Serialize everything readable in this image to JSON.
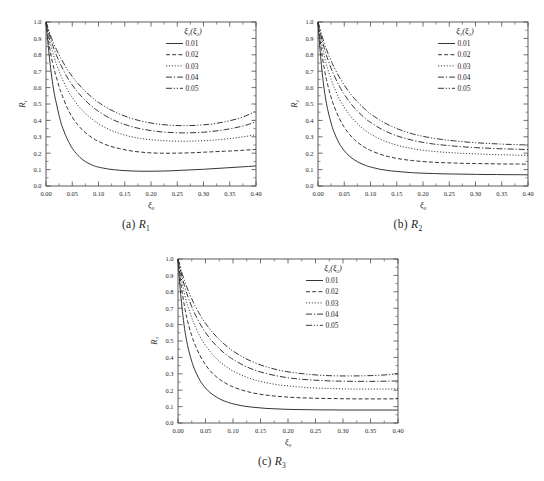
{
  "figure": {
    "background": "#ffffff",
    "line_color": "#2b2b2b",
    "axis_color": "#4a4a4a"
  },
  "panels": [
    {
      "id": "a",
      "caption_prefix": "(a)",
      "caption_symbol": "R",
      "caption_subscript": "1"
    },
    {
      "id": "b",
      "caption_prefix": "(b)",
      "caption_symbol": "R",
      "caption_subscript": "2"
    },
    {
      "id": "c",
      "caption_prefix": "(c)",
      "caption_symbol": "R",
      "caption_subscript": "3"
    }
  ],
  "legend": {
    "header_main": "ξ",
    "header_sub1": "1",
    "header_paren_open": "(",
    "header_main2": "ξ",
    "header_sub2": "2",
    "header_paren_close": ")",
    "entries": [
      {
        "label": "0.01",
        "dash": "none"
      },
      {
        "label": "0.02",
        "dash": "4,2.2"
      },
      {
        "label": "0.03",
        "dash": "1.1,1.8"
      },
      {
        "label": "0.04",
        "dash": "6,2,1.2,2"
      },
      {
        "label": "0.05",
        "dash": "6,1.8,1.2,1.8,1.2,1.8"
      }
    ]
  },
  "chart_data": [
    {
      "type": "line",
      "title": "(a) R1",
      "xlabel": "ξ0",
      "ylabel": "R1",
      "xlim": [
        0.0,
        0.4
      ],
      "ylim": [
        0.0,
        1.0
      ],
      "xticks": [
        "0.00",
        "0.05",
        "0.10",
        "0.15",
        "0.20",
        "0.25",
        "0.30",
        "0.35",
        "0.40"
      ],
      "yticks": [
        "0.0",
        "0.1",
        "0.2",
        "0.3",
        "0.4",
        "0.5",
        "0.6",
        "0.7",
        "0.8",
        "0.9",
        "1.0"
      ],
      "grid": false,
      "legend_position": "top-right",
      "legend_title": "ξ1(ξ2)",
      "x": [
        0.0,
        0.002,
        0.005,
        0.008,
        0.012,
        0.016,
        0.02,
        0.025,
        0.03,
        0.04,
        0.05,
        0.06,
        0.07,
        0.08,
        0.09,
        0.1,
        0.12,
        0.14,
        0.16,
        0.18,
        0.2,
        0.22,
        0.24,
        0.26,
        0.28,
        0.3,
        0.32,
        0.34,
        0.36,
        0.38,
        0.4
      ],
      "series": [
        {
          "name": "0.01",
          "dash": "none",
          "values": [
            1.0,
            0.93,
            0.83,
            0.74,
            0.64,
            0.56,
            0.5,
            0.43,
            0.37,
            0.29,
            0.23,
            0.19,
            0.16,
            0.14,
            0.125,
            0.115,
            0.103,
            0.096,
            0.092,
            0.09,
            0.09,
            0.091,
            0.093,
            0.096,
            0.099,
            0.102,
            0.106,
            0.11,
            0.114,
            0.118,
            0.122
          ]
        },
        {
          "name": "0.02",
          "dash": "4,2.2",
          "values": [
            1.0,
            0.955,
            0.885,
            0.825,
            0.76,
            0.705,
            0.66,
            0.605,
            0.56,
            0.48,
            0.42,
            0.375,
            0.34,
            0.312,
            0.29,
            0.272,
            0.245,
            0.228,
            0.215,
            0.207,
            0.202,
            0.2,
            0.2,
            0.201,
            0.203,
            0.206,
            0.209,
            0.212,
            0.215,
            0.219,
            0.223
          ]
        },
        {
          "name": "0.03",
          "dash": "1.1,1.8",
          "values": [
            1.0,
            0.97,
            0.92,
            0.875,
            0.825,
            0.78,
            0.742,
            0.7,
            0.66,
            0.592,
            0.54,
            0.495,
            0.458,
            0.428,
            0.402,
            0.38,
            0.345,
            0.32,
            0.302,
            0.29,
            0.282,
            0.277,
            0.274,
            0.273,
            0.274,
            0.276,
            0.28,
            0.286,
            0.293,
            0.302,
            0.313
          ]
        },
        {
          "name": "0.04",
          "dash": "6,2,1.2,2",
          "values": [
            1.0,
            0.978,
            0.94,
            0.905,
            0.865,
            0.828,
            0.796,
            0.76,
            0.726,
            0.665,
            0.616,
            0.574,
            0.538,
            0.506,
            0.479,
            0.455,
            0.416,
            0.387,
            0.365,
            0.349,
            0.338,
            0.33,
            0.326,
            0.324,
            0.325,
            0.328,
            0.334,
            0.343,
            0.355,
            0.37,
            0.392
          ]
        },
        {
          "name": "0.05",
          "dash": "6,1.8,1.2,1.8,1.2,1.8",
          "values": [
            1.0,
            0.982,
            0.952,
            0.924,
            0.89,
            0.859,
            0.831,
            0.799,
            0.769,
            0.714,
            0.668,
            0.628,
            0.593,
            0.562,
            0.534,
            0.51,
            0.47,
            0.439,
            0.415,
            0.397,
            0.384,
            0.375,
            0.37,
            0.368,
            0.369,
            0.373,
            0.38,
            0.391,
            0.406,
            0.427,
            0.458
          ]
        }
      ]
    },
    {
      "type": "line",
      "title": "(b) R2",
      "xlabel": "ξ0",
      "ylabel": "R2",
      "xlim": [
        0.0,
        0.4
      ],
      "ylim": [
        0.0,
        1.0
      ],
      "xticks": [
        "0.00",
        "0.05",
        "0.10",
        "0.15",
        "0.20",
        "0.25",
        "0.30",
        "0.35",
        "0.40"
      ],
      "yticks": [
        "0.0",
        "0.1",
        "0.2",
        "0.3",
        "0.4",
        "0.5",
        "0.6",
        "0.7",
        "0.8",
        "0.9",
        "1.0"
      ],
      "grid": false,
      "legend_position": "top-right",
      "legend_title": "ξ1(ξ2)",
      "x": [
        0.0,
        0.002,
        0.005,
        0.008,
        0.012,
        0.016,
        0.02,
        0.025,
        0.03,
        0.04,
        0.05,
        0.06,
        0.07,
        0.08,
        0.09,
        0.1,
        0.12,
        0.14,
        0.16,
        0.18,
        0.2,
        0.22,
        0.24,
        0.26,
        0.28,
        0.3,
        0.32,
        0.34,
        0.36,
        0.38,
        0.4
      ],
      "series": [
        {
          "name": "0.01",
          "dash": "none",
          "values": [
            1.0,
            0.905,
            0.79,
            0.69,
            0.585,
            0.505,
            0.445,
            0.383,
            0.333,
            0.262,
            0.215,
            0.182,
            0.158,
            0.14,
            0.126,
            0.116,
            0.101,
            0.092,
            0.086,
            0.081,
            0.078,
            0.076,
            0.074,
            0.073,
            0.072,
            0.071,
            0.07,
            0.07,
            0.069,
            0.069,
            0.068
          ]
        },
        {
          "name": "0.02",
          "dash": "4,2.2",
          "values": [
            1.0,
            0.945,
            0.865,
            0.795,
            0.715,
            0.65,
            0.598,
            0.54,
            0.492,
            0.416,
            0.358,
            0.315,
            0.281,
            0.255,
            0.234,
            0.217,
            0.192,
            0.175,
            0.163,
            0.155,
            0.149,
            0.145,
            0.142,
            0.14,
            0.138,
            0.137,
            0.136,
            0.135,
            0.134,
            0.134,
            0.133
          ]
        },
        {
          "name": "0.03",
          "dash": "1.1,1.8",
          "values": [
            1.0,
            0.963,
            0.905,
            0.853,
            0.793,
            0.742,
            0.699,
            0.65,
            0.607,
            0.536,
            0.48,
            0.434,
            0.396,
            0.365,
            0.339,
            0.317,
            0.283,
            0.259,
            0.241,
            0.228,
            0.218,
            0.211,
            0.206,
            0.202,
            0.198,
            0.196,
            0.193,
            0.191,
            0.19,
            0.188,
            0.187
          ]
        },
        {
          "name": "0.04",
          "dash": "6,2,1.2,2",
          "values": [
            1.0,
            0.973,
            0.928,
            0.888,
            0.84,
            0.797,
            0.76,
            0.717,
            0.679,
            0.613,
            0.559,
            0.513,
            0.474,
            0.441,
            0.412,
            0.388,
            0.348,
            0.318,
            0.296,
            0.279,
            0.266,
            0.256,
            0.249,
            0.243,
            0.238,
            0.234,
            0.231,
            0.228,
            0.226,
            0.224,
            0.222
          ]
        },
        {
          "name": "0.05",
          "dash": "6,1.8,1.2,1.8,1.2,1.8",
          "values": [
            1.0,
            0.979,
            0.943,
            0.91,
            0.87,
            0.834,
            0.801,
            0.763,
            0.728,
            0.667,
            0.615,
            0.57,
            0.531,
            0.497,
            0.467,
            0.44,
            0.397,
            0.364,
            0.338,
            0.318,
            0.303,
            0.291,
            0.282,
            0.275,
            0.269,
            0.264,
            0.26,
            0.257,
            0.254,
            0.252,
            0.25
          ]
        }
      ]
    },
    {
      "type": "line",
      "title": "(c) R3",
      "xlabel": "ξ0",
      "ylabel": "R3",
      "xlim": [
        0.0,
        0.4
      ],
      "ylim": [
        0.0,
        1.0
      ],
      "xticks": [
        "0.00",
        "0.05",
        "0.10",
        "0.15",
        "0.20",
        "0.25",
        "0.30",
        "0.35",
        "0.40"
      ],
      "yticks": [
        "0.0",
        "0.1",
        "0.2",
        "0.3",
        "0.4",
        "0.5",
        "0.6",
        "0.7",
        "0.8",
        "0.9",
        "1.0"
      ],
      "grid": false,
      "legend_position": "top-right",
      "legend_title": "ξ1(ξ2)",
      "x": [
        0.0,
        0.002,
        0.005,
        0.008,
        0.012,
        0.016,
        0.02,
        0.025,
        0.03,
        0.04,
        0.05,
        0.06,
        0.07,
        0.08,
        0.09,
        0.1,
        0.12,
        0.14,
        0.16,
        0.18,
        0.2,
        0.22,
        0.24,
        0.26,
        0.28,
        0.3,
        0.32,
        0.34,
        0.36,
        0.38,
        0.4
      ],
      "series": [
        {
          "name": "0.01",
          "dash": "none",
          "values": [
            1.0,
            0.9,
            0.782,
            0.68,
            0.575,
            0.496,
            0.436,
            0.376,
            0.328,
            0.259,
            0.213,
            0.181,
            0.158,
            0.14,
            0.127,
            0.117,
            0.103,
            0.095,
            0.089,
            0.086,
            0.083,
            0.082,
            0.081,
            0.08,
            0.08,
            0.079,
            0.079,
            0.079,
            0.079,
            0.079,
            0.079
          ]
        },
        {
          "name": "0.02",
          "dash": "4,2.2",
          "values": [
            1.0,
            0.942,
            0.86,
            0.788,
            0.707,
            0.642,
            0.589,
            0.532,
            0.485,
            0.411,
            0.355,
            0.313,
            0.281,
            0.256,
            0.236,
            0.22,
            0.197,
            0.181,
            0.17,
            0.163,
            0.158,
            0.154,
            0.152,
            0.15,
            0.149,
            0.148,
            0.147,
            0.147,
            0.147,
            0.147,
            0.148
          ]
        },
        {
          "name": "0.03",
          "dash": "1.1,1.8",
          "values": [
            1.0,
            0.961,
            0.901,
            0.847,
            0.786,
            0.734,
            0.69,
            0.641,
            0.598,
            0.528,
            0.473,
            0.429,
            0.393,
            0.363,
            0.338,
            0.317,
            0.285,
            0.262,
            0.246,
            0.234,
            0.226,
            0.22,
            0.215,
            0.212,
            0.21,
            0.208,
            0.207,
            0.207,
            0.207,
            0.207,
            0.208
          ]
        },
        {
          "name": "0.04",
          "dash": "6,2,1.2,2",
          "values": [
            1.0,
            0.971,
            0.925,
            0.883,
            0.834,
            0.79,
            0.752,
            0.709,
            0.67,
            0.605,
            0.552,
            0.507,
            0.47,
            0.438,
            0.411,
            0.388,
            0.35,
            0.322,
            0.302,
            0.287,
            0.276,
            0.268,
            0.263,
            0.259,
            0.256,
            0.255,
            0.254,
            0.254,
            0.254,
            0.255,
            0.257
          ]
        },
        {
          "name": "0.05",
          "dash": "6,1.8,1.2,1.8,1.2,1.8",
          "values": [
            1.0,
            0.978,
            0.941,
            0.907,
            0.866,
            0.829,
            0.795,
            0.757,
            0.721,
            0.66,
            0.608,
            0.564,
            0.526,
            0.493,
            0.464,
            0.439,
            0.398,
            0.367,
            0.343,
            0.325,
            0.312,
            0.303,
            0.296,
            0.291,
            0.288,
            0.287,
            0.287,
            0.288,
            0.29,
            0.294,
            0.3
          ]
        }
      ]
    }
  ]
}
